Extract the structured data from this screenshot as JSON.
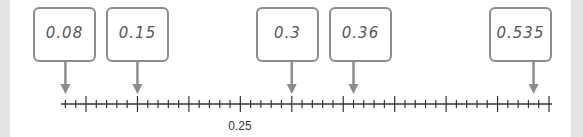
{
  "diagram": {
    "type": "number-line",
    "range": [
      0.08,
      0.55
    ],
    "minor_step": 0.01,
    "major_step": 0.05,
    "tick_labels": [
      {
        "value": 0.25,
        "label": "0.25"
      }
    ],
    "markers": [
      {
        "value": 0.08,
        "label": "0.08"
      },
      {
        "value": 0.15,
        "label": "0.15"
      },
      {
        "value": 0.3,
        "label": "0.3"
      },
      {
        "value": 0.36,
        "label": "0.36"
      },
      {
        "value": 0.535,
        "label": "0.535"
      }
    ],
    "colors": {
      "axis": "#333333",
      "arrow": "#8c8c8c",
      "box_border": "#8c8c8c",
      "side_bars": "#e4e4e4"
    }
  }
}
